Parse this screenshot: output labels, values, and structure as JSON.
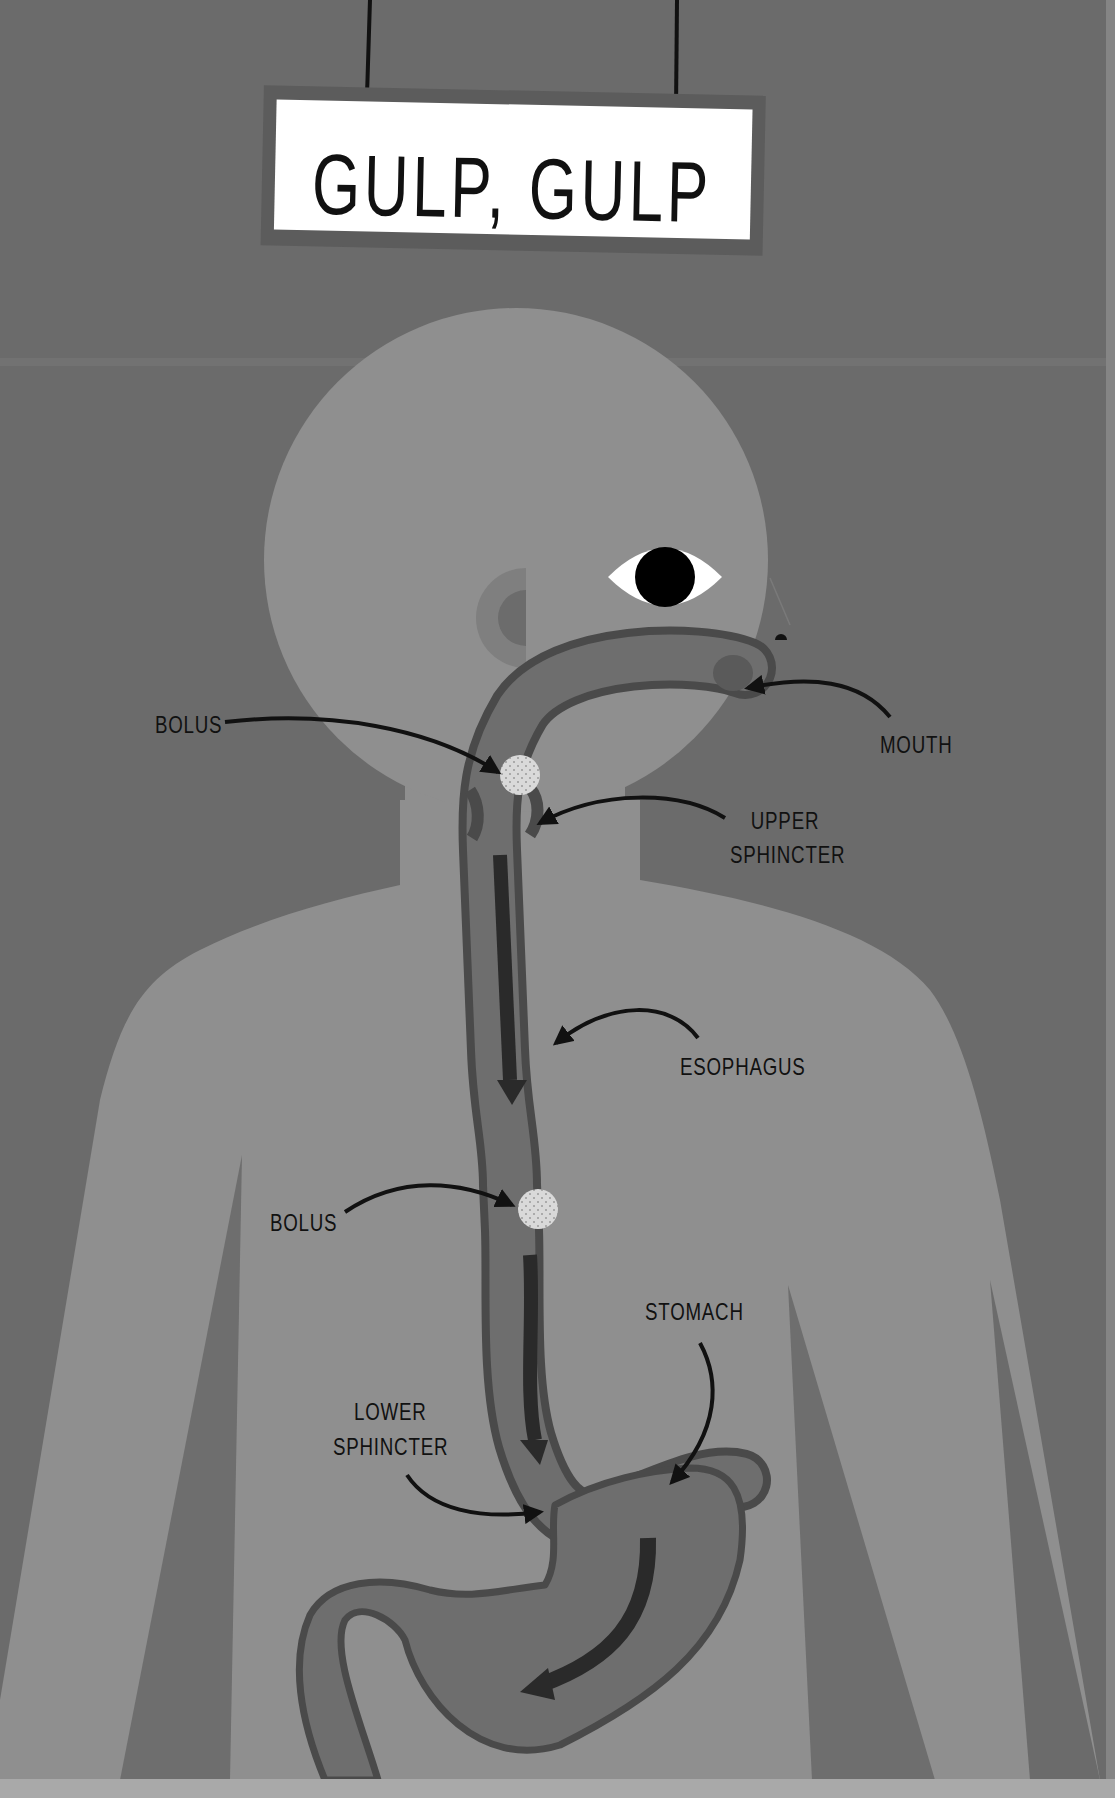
{
  "sign": {
    "title": "GULP, GULP"
  },
  "labels": {
    "bolus_upper": "BOLUS",
    "mouth": "MOUTH",
    "upper_sphincter_line1": "UPPER",
    "upper_sphincter_line2": "SPHINCTER",
    "esophagus": "ESOPHAGUS",
    "bolus_lower": "BOLUS",
    "stomach": "STOMACH",
    "lower_sphincter_line1": "LOWER",
    "lower_sphincter_line2": "SPHINCTER"
  },
  "colors": {
    "background": "#6b6b6b",
    "body": "#8f8f8f",
    "tract_fill": "#6e6e6e",
    "tract_outline": "#4a4a4a",
    "flow_arrow": "#2a2a2a",
    "bolus": "#d9d9d9",
    "sign_face": "#ffffff",
    "sign_frame": "#5c5c5c",
    "label_text": "#111111"
  }
}
